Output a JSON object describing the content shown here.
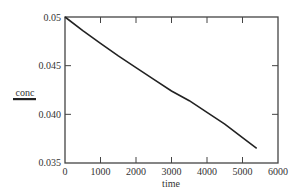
{
  "chart_data": {
    "type": "line",
    "title": "",
    "xlabel": "time",
    "ylabel": "conc",
    "xlim": [
      0,
      6000
    ],
    "ylim": [
      0.035,
      0.05
    ],
    "x_ticks": [
      0,
      1000,
      2000,
      3000,
      4000,
      5000,
      6000
    ],
    "x_tick_labels": [
      "0",
      "1000",
      "2000",
      "3000",
      "4000",
      "5000",
      "6000"
    ],
    "y_ticks": [
      0.035,
      0.04,
      0.045,
      0.05
    ],
    "y_tick_labels": [
      "0.035",
      "0.040",
      "0.045",
      "0.05"
    ],
    "grid": false,
    "legend": null,
    "series": [
      {
        "name": "conc",
        "color": "#222222",
        "x": [
          0,
          500,
          1000,
          1500,
          2000,
          2500,
          3000,
          3500,
          4000,
          4500,
          5000,
          5400
        ],
        "y": [
          0.05,
          0.0486,
          0.0473,
          0.046,
          0.0448,
          0.0436,
          0.0424,
          0.0414,
          0.0402,
          0.039,
          0.0376,
          0.0365
        ]
      }
    ]
  }
}
